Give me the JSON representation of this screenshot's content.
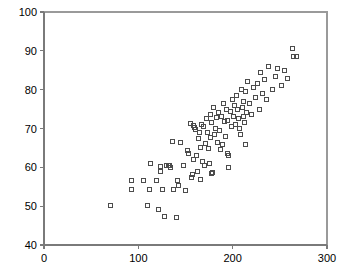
{
  "chart_data": {
    "type": "scatter",
    "title": "",
    "xlabel": "",
    "ylabel": "",
    "xlim": [
      0,
      300
    ],
    "ylim": [
      40,
      100
    ],
    "xticks": [
      0,
      100,
      200,
      300
    ],
    "yticks": [
      40,
      50,
      60,
      70,
      80,
      90,
      100
    ],
    "grid": false,
    "legend": null,
    "marker": "open-square",
    "marker_color": "#4c4c4c",
    "marker_size": 4,
    "series": [
      {
        "name": "series-1",
        "points": [
          [
            70,
            50.1
          ],
          [
            93,
            56.5
          ],
          [
            93,
            54.2
          ],
          [
            106,
            56.5
          ],
          [
            110,
            50.3
          ],
          [
            112,
            54.2
          ],
          [
            113,
            61.0
          ],
          [
            119,
            56.5
          ],
          [
            121,
            49.2
          ],
          [
            123,
            60.2
          ],
          [
            124,
            58.8
          ],
          [
            126,
            54.2
          ],
          [
            128,
            47.3
          ],
          [
            130,
            60.6
          ],
          [
            132,
            60.4
          ],
          [
            133,
            60.6
          ],
          [
            134,
            60.0
          ],
          [
            136,
            66.7
          ],
          [
            137,
            54.2
          ],
          [
            140,
            47.0
          ],
          [
            141,
            56.6
          ],
          [
            143,
            55.3
          ],
          [
            145,
            66.5
          ],
          [
            148,
            60.5
          ],
          [
            150,
            54.1
          ],
          [
            152,
            64.3
          ],
          [
            153,
            63.5
          ],
          [
            155,
            71.3
          ],
          [
            156,
            57.5
          ],
          [
            157,
            58.2
          ],
          [
            158,
            62.0
          ],
          [
            159,
            70.8
          ],
          [
            160,
            70.2
          ],
          [
            161,
            69.8
          ],
          [
            162,
            63.0
          ],
          [
            163,
            59.0
          ],
          [
            164,
            67.5
          ],
          [
            165,
            68.9
          ],
          [
            166,
            65.0
          ],
          [
            167,
            71.0
          ],
          [
            168,
            61.5
          ],
          [
            169,
            70.4
          ],
          [
            170,
            60.5
          ],
          [
            171,
            66.2
          ],
          [
            172,
            72.5
          ],
          [
            173,
            69.0
          ],
          [
            174,
            64.8
          ],
          [
            175,
            61.0
          ],
          [
            176,
            73.5
          ],
          [
            177,
            67.8
          ],
          [
            178,
            71.5
          ],
          [
            179,
            58.6
          ],
          [
            180,
            75.5
          ],
          [
            181,
            68.5
          ],
          [
            182,
            70.0
          ],
          [
            183,
            72.8
          ],
          [
            184,
            66.5
          ],
          [
            185,
            74.0
          ],
          [
            186,
            69.5
          ],
          [
            187,
            64.5
          ],
          [
            188,
            73.0
          ],
          [
            189,
            65.8
          ],
          [
            190,
            76.5
          ],
          [
            191,
            71.8
          ],
          [
            192,
            68.0
          ],
          [
            193,
            75.0
          ],
          [
            194,
            72.0
          ],
          [
            195,
            63.5
          ],
          [
            196,
            60.0
          ],
          [
            198,
            74.5
          ],
          [
            199,
            70.5
          ],
          [
            200,
            77.5
          ],
          [
            201,
            73.2
          ],
          [
            202,
            76.0
          ],
          [
            203,
            71.0
          ],
          [
            204,
            78.5
          ],
          [
            205,
            74.8
          ],
          [
            206,
            72.5
          ],
          [
            207,
            70.0
          ],
          [
            208,
            68.5
          ],
          [
            209,
            80.0
          ],
          [
            210,
            75.5
          ],
          [
            211,
            73.0
          ],
          [
            212,
            77.0
          ],
          [
            213,
            71.5
          ],
          [
            214,
            79.5
          ],
          [
            215,
            74.0
          ],
          [
            216,
            82.0
          ],
          [
            218,
            76.5
          ],
          [
            220,
            73.5
          ],
          [
            222,
            80.5
          ],
          [
            224,
            78.0
          ],
          [
            226,
            81.5
          ],
          [
            228,
            75.0
          ],
          [
            230,
            84.5
          ],
          [
            232,
            79.0
          ],
          [
            234,
            82.5
          ],
          [
            236,
            77.5
          ],
          [
            238,
            86.0
          ],
          [
            242,
            80.0
          ],
          [
            245,
            83.5
          ],
          [
            248,
            85.5
          ],
          [
            252,
            81.0
          ],
          [
            255,
            85.0
          ],
          [
            258,
            83.0
          ],
          [
            263,
            90.5
          ],
          [
            265,
            88.5
          ],
          [
            268,
            88.5
          ],
          [
            214,
            66.0
          ],
          [
            196,
            63.0
          ],
          [
            178,
            58.5
          ],
          [
            166,
            56.8
          ]
        ]
      }
    ]
  },
  "axes": {
    "left": 44,
    "right": 327,
    "top": 12,
    "bottom": 245
  }
}
